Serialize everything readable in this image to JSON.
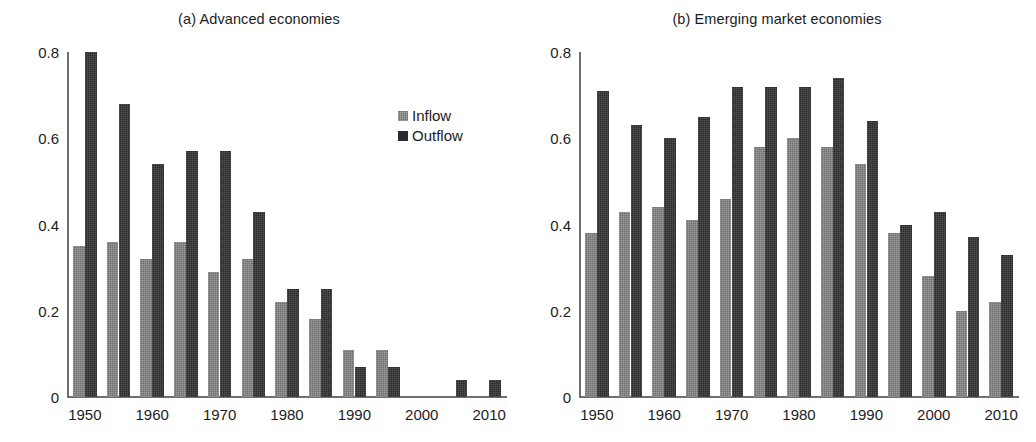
{
  "figure": {
    "panels": [
      {
        "id": "advanced",
        "title": "(a) Advanced economies"
      },
      {
        "id": "emerging",
        "title": "(b) Emerging market economies"
      }
    ]
  },
  "legend": {
    "inflow_label": "Inflow",
    "outflow_label": "Outflow",
    "inflow_color": "#6f6f6f",
    "outflow_color": "#2b2b2b",
    "position": "upper-right-inside"
  },
  "chart_data": [
    {
      "type": "bar",
      "title": "(a) Advanced economies",
      "xlabel": "",
      "ylabel": "",
      "ylim": [
        0,
        0.8
      ],
      "yticks": [
        0,
        0.2,
        0.4,
        0.6,
        0.8
      ],
      "ytick_labels": [
        "0",
        "0.2",
        "0.4",
        "0.6",
        "0.8"
      ],
      "grid": false,
      "categories": [
        1950,
        1955,
        1960,
        1965,
        1970,
        1975,
        1980,
        1985,
        1990,
        1995,
        2000,
        2005,
        2010
      ],
      "xtick_values": [
        1950,
        1960,
        1970,
        1980,
        1990,
        2000,
        2010
      ],
      "xtick_labels": [
        "1950",
        "1960",
        "1970",
        "1980",
        "1990",
        "2000",
        "2010"
      ],
      "series": [
        {
          "name": "Inflow",
          "color": "#6f6f6f",
          "values": [
            0.35,
            0.36,
            0.32,
            0.36,
            0.29,
            0.32,
            0.22,
            0.18,
            0.11,
            0.11,
            0.0,
            0.0,
            0.0
          ]
        },
        {
          "name": "Outflow",
          "color": "#2b2b2b",
          "values": [
            0.8,
            0.68,
            0.54,
            0.57,
            0.57,
            0.43,
            0.25,
            0.25,
            0.07,
            0.07,
            0.0,
            0.04,
            0.04
          ]
        }
      ]
    },
    {
      "type": "bar",
      "title": "(b) Emerging market economies",
      "xlabel": "",
      "ylabel": "",
      "ylim": [
        0,
        0.8
      ],
      "yticks": [
        0,
        0.2,
        0.4,
        0.6,
        0.8
      ],
      "ytick_labels": [
        "0",
        "0.2",
        "0.4",
        "0.6",
        "0.8"
      ],
      "grid": false,
      "categories": [
        1950,
        1955,
        1960,
        1965,
        1970,
        1975,
        1980,
        1985,
        1990,
        1995,
        2000,
        2005,
        2010
      ],
      "xtick_values": [
        1950,
        1960,
        1970,
        1980,
        1990,
        2000,
        2010
      ],
      "xtick_labels": [
        "1950",
        "1960",
        "1970",
        "1980",
        "1990",
        "2000",
        "2010"
      ],
      "series": [
        {
          "name": "Inflow",
          "color": "#6f6f6f",
          "values": [
            0.38,
            0.43,
            0.44,
            0.41,
            0.46,
            0.58,
            0.6,
            0.58,
            0.54,
            0.38,
            0.28,
            0.2,
            0.22
          ]
        },
        {
          "name": "Outflow",
          "color": "#2b2b2b",
          "values": [
            0.71,
            0.63,
            0.6,
            0.65,
            0.72,
            0.72,
            0.72,
            0.74,
            0.64,
            0.4,
            0.43,
            0.37,
            0.33
          ]
        }
      ]
    }
  ]
}
